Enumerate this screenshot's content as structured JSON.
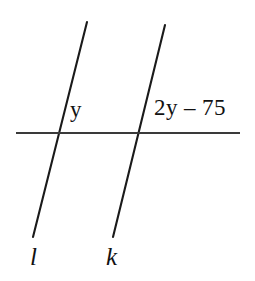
{
  "figure": {
    "type": "geometry-diagram",
    "background_color": "#ffffff",
    "stroke_color": "#1a1a1a",
    "transversal_color": "#3a3a3a",
    "labels": {
      "angle_left": "y",
      "angle_right": "2y – 75",
      "line_left": "l",
      "line_right": "k"
    },
    "geometry": {
      "line_l": {
        "x1": 87,
        "y1": 22,
        "x2": 33,
        "y2": 237,
        "stroke_width": 2.1
      },
      "line_k": {
        "x1": 165,
        "y1": 25,
        "x2": 113,
        "y2": 237,
        "stroke_width": 2.1
      },
      "transversal": {
        "x1": 16,
        "y1": 133,
        "x2": 240,
        "y2": 133,
        "stroke_width": 2.0
      },
      "intersection_l": {
        "x": 59,
        "y": 133
      },
      "intersection_k": {
        "x": 140,
        "y": 133
      }
    }
  }
}
